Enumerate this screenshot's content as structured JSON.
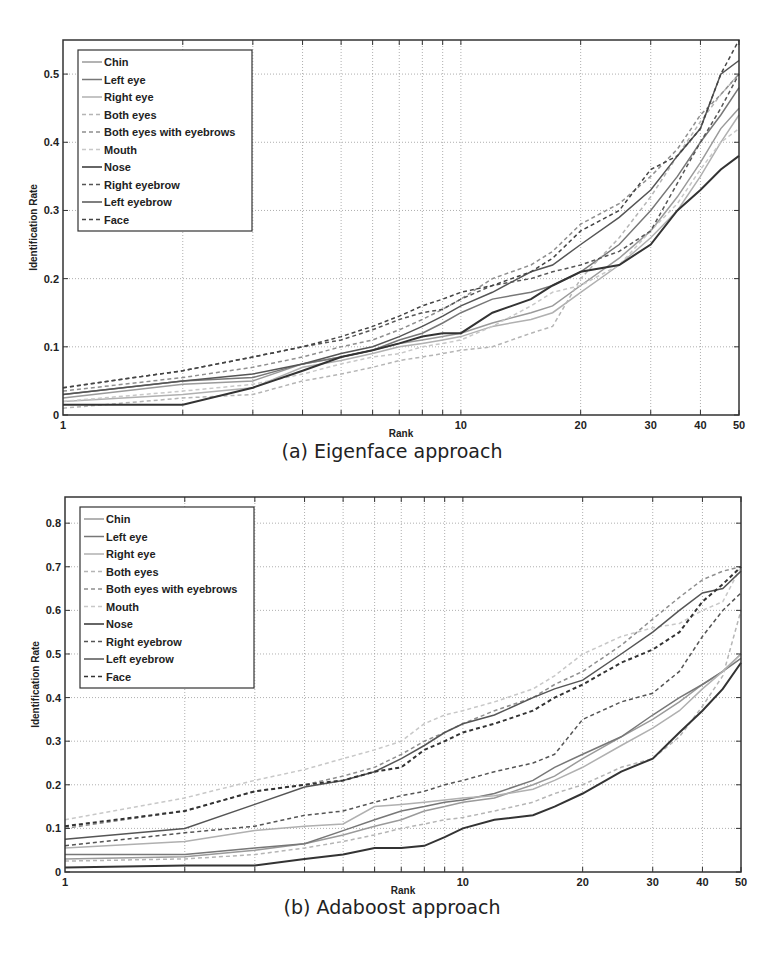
{
  "figures": [
    {
      "caption": "(a) Eigenface approach",
      "xlabel": "Rank",
      "ylabel": "Identification Rate"
    },
    {
      "caption": "(b) Adaboost approach",
      "xlabel": "Rank",
      "ylabel": "Identification Rate"
    }
  ],
  "chart_data": [
    {
      "type": "line",
      "title": "(a) Eigenface approach",
      "xlabel": "Rank",
      "ylabel": "Identification Rate",
      "xscale": "log",
      "xlim": [
        1,
        50
      ],
      "ylim": [
        0,
        0.55
      ],
      "xticks": [
        1,
        10,
        20,
        30,
        40,
        50
      ],
      "yticks": [
        0,
        0.1,
        0.2,
        0.3,
        0.4,
        0.5
      ],
      "grid": true,
      "legend_position": "upper left",
      "x": [
        1,
        2,
        3,
        4,
        5,
        6,
        7,
        8,
        9,
        10,
        12,
        15,
        17,
        20,
        25,
        30,
        35,
        40,
        45,
        50
      ],
      "series": [
        {
          "name": "Chin",
          "style": "solid",
          "color": "#9a9a9a",
          "values": [
            0.025,
            0.045,
            0.05,
            0.075,
            0.085,
            0.095,
            0.105,
            0.11,
            0.115,
            0.12,
            0.135,
            0.15,
            0.16,
            0.19,
            0.23,
            0.27,
            0.32,
            0.37,
            0.42,
            0.45
          ]
        },
        {
          "name": "Left eye",
          "style": "solid",
          "color": "#777777",
          "values": [
            0.03,
            0.05,
            0.055,
            0.075,
            0.085,
            0.095,
            0.11,
            0.12,
            0.135,
            0.15,
            0.17,
            0.18,
            0.19,
            0.21,
            0.25,
            0.3,
            0.35,
            0.4,
            0.44,
            0.48
          ]
        },
        {
          "name": "Right eye",
          "style": "solid",
          "color": "#b0b0b0",
          "values": [
            0.02,
            0.03,
            0.04,
            0.07,
            0.08,
            0.09,
            0.1,
            0.105,
            0.11,
            0.115,
            0.13,
            0.14,
            0.15,
            0.18,
            0.22,
            0.26,
            0.3,
            0.35,
            0.4,
            0.44
          ]
        },
        {
          "name": "Both eyes",
          "style": "dashed",
          "color": "#b5b5b5",
          "values": [
            0.01,
            0.025,
            0.03,
            0.05,
            0.06,
            0.07,
            0.08,
            0.085,
            0.09,
            0.095,
            0.1,
            0.12,
            0.13,
            0.2,
            0.26,
            0.32,
            0.38,
            0.43,
            0.47,
            0.5
          ]
        },
        {
          "name": "Both eyes with eyebrows",
          "style": "dashed",
          "color": "#8f8f8f",
          "values": [
            0.035,
            0.055,
            0.07,
            0.085,
            0.1,
            0.11,
            0.125,
            0.14,
            0.155,
            0.17,
            0.2,
            0.22,
            0.24,
            0.28,
            0.31,
            0.35,
            0.39,
            0.44,
            0.47,
            0.5
          ]
        },
        {
          "name": "Mouth",
          "style": "dashed",
          "color": "#c8c8c8",
          "values": [
            0.02,
            0.035,
            0.045,
            0.06,
            0.075,
            0.085,
            0.09,
            0.1,
            0.105,
            0.11,
            0.13,
            0.16,
            0.18,
            0.19,
            0.22,
            0.27,
            0.31,
            0.36,
            0.4,
            0.42
          ]
        },
        {
          "name": "Nose",
          "style": "solid",
          "color": "#333333",
          "values": [
            0.015,
            0.015,
            0.04,
            0.065,
            0.085,
            0.095,
            0.105,
            0.115,
            0.12,
            0.12,
            0.15,
            0.17,
            0.19,
            0.21,
            0.22,
            0.25,
            0.3,
            0.33,
            0.36,
            0.38
          ]
        },
        {
          "name": "Right eyebrow",
          "style": "dashed",
          "color": "#555555",
          "values": [
            0.04,
            0.065,
            0.085,
            0.1,
            0.11,
            0.125,
            0.14,
            0.15,
            0.155,
            0.17,
            0.19,
            0.2,
            0.21,
            0.22,
            0.24,
            0.27,
            0.34,
            0.4,
            0.45,
            0.5
          ]
        },
        {
          "name": "Left eyebrow",
          "style": "solid",
          "color": "#555555",
          "values": [
            0.03,
            0.05,
            0.06,
            0.075,
            0.09,
            0.1,
            0.115,
            0.13,
            0.145,
            0.16,
            0.18,
            0.21,
            0.22,
            0.25,
            0.29,
            0.33,
            0.38,
            0.42,
            0.5,
            0.52
          ]
        },
        {
          "name": "Face",
          "style": "dashed",
          "color": "#444444",
          "values": [
            0.04,
            0.065,
            0.085,
            0.1,
            0.115,
            0.13,
            0.145,
            0.16,
            0.17,
            0.18,
            0.19,
            0.21,
            0.23,
            0.27,
            0.3,
            0.36,
            0.38,
            0.42,
            0.5,
            0.55
          ]
        }
      ]
    },
    {
      "type": "line",
      "title": "(b) Adaboost approach",
      "xlabel": "Rank",
      "ylabel": "Identification Rate",
      "xscale": "log",
      "xlim": [
        1,
        50
      ],
      "ylim": [
        0,
        0.86
      ],
      "xticks": [
        1,
        10,
        20,
        30,
        40,
        50
      ],
      "yticks": [
        0,
        0.1,
        0.2,
        0.3,
        0.4,
        0.5,
        0.6,
        0.7,
        0.8
      ],
      "grid": true,
      "legend_position": "upper left",
      "x": [
        1,
        2,
        3,
        4,
        5,
        6,
        7,
        8,
        9,
        10,
        12,
        15,
        17,
        20,
        25,
        30,
        35,
        40,
        45,
        50
      ],
      "series": [
        {
          "name": "Chin",
          "style": "solid",
          "color": "#9a9a9a",
          "values": [
            0.03,
            0.035,
            0.05,
            0.065,
            0.085,
            0.105,
            0.12,
            0.14,
            0.15,
            0.16,
            0.17,
            0.2,
            0.22,
            0.26,
            0.31,
            0.35,
            0.39,
            0.43,
            0.46,
            0.5
          ]
        },
        {
          "name": "Left eye",
          "style": "solid",
          "color": "#777777",
          "values": [
            0.04,
            0.04,
            0.055,
            0.065,
            0.095,
            0.12,
            0.14,
            0.15,
            0.16,
            0.165,
            0.18,
            0.21,
            0.24,
            0.27,
            0.31,
            0.36,
            0.4,
            0.43,
            0.46,
            0.49
          ]
        },
        {
          "name": "Right eye",
          "style": "solid",
          "color": "#b0b0b0",
          "values": [
            0.055,
            0.07,
            0.095,
            0.105,
            0.11,
            0.15,
            0.155,
            0.16,
            0.165,
            0.17,
            0.175,
            0.19,
            0.21,
            0.24,
            0.29,
            0.33,
            0.37,
            0.42,
            0.46,
            0.5
          ]
        },
        {
          "name": "Both eyes",
          "style": "dashed",
          "color": "#b5b5b5",
          "values": [
            0.025,
            0.03,
            0.04,
            0.055,
            0.07,
            0.085,
            0.1,
            0.11,
            0.12,
            0.125,
            0.14,
            0.16,
            0.18,
            0.2,
            0.24,
            0.26,
            0.31,
            0.38,
            0.45,
            0.6
          ]
        },
        {
          "name": "Both eyes with eyebrows",
          "style": "dashed",
          "color": "#8f8f8f",
          "values": [
            0.1,
            0.14,
            0.185,
            0.2,
            0.22,
            0.24,
            0.27,
            0.3,
            0.32,
            0.34,
            0.37,
            0.4,
            0.43,
            0.46,
            0.52,
            0.58,
            0.63,
            0.67,
            0.69,
            0.7
          ]
        },
        {
          "name": "Mouth",
          "style": "dashed",
          "color": "#c8c8c8",
          "values": [
            0.12,
            0.17,
            0.21,
            0.235,
            0.26,
            0.28,
            0.3,
            0.34,
            0.36,
            0.37,
            0.39,
            0.42,
            0.45,
            0.5,
            0.54,
            0.56,
            0.57,
            0.6,
            0.62,
            0.7
          ]
        },
        {
          "name": "Nose",
          "style": "solid",
          "color": "#333333",
          "values": [
            0.01,
            0.015,
            0.015,
            0.03,
            0.04,
            0.055,
            0.055,
            0.06,
            0.08,
            0.1,
            0.12,
            0.13,
            0.15,
            0.18,
            0.23,
            0.26,
            0.32,
            0.37,
            0.42,
            0.48
          ]
        },
        {
          "name": "Right eyebrow",
          "style": "dashed",
          "color": "#555555",
          "values": [
            0.06,
            0.09,
            0.105,
            0.13,
            0.14,
            0.16,
            0.175,
            0.185,
            0.2,
            0.21,
            0.23,
            0.25,
            0.27,
            0.35,
            0.39,
            0.41,
            0.46,
            0.54,
            0.6,
            0.64
          ]
        },
        {
          "name": "Left eyebrow",
          "style": "solid",
          "color": "#555555",
          "values": [
            0.075,
            0.1,
            0.155,
            0.195,
            0.21,
            0.23,
            0.26,
            0.29,
            0.32,
            0.34,
            0.36,
            0.4,
            0.42,
            0.44,
            0.5,
            0.55,
            0.6,
            0.64,
            0.65,
            0.69
          ]
        },
        {
          "name": "Face",
          "style": "dashed",
          "color": "#333333",
          "values": [
            0.105,
            0.14,
            0.185,
            0.2,
            0.21,
            0.23,
            0.24,
            0.28,
            0.3,
            0.32,
            0.34,
            0.37,
            0.4,
            0.43,
            0.48,
            0.51,
            0.55,
            0.62,
            0.66,
            0.7
          ]
        }
      ]
    }
  ]
}
